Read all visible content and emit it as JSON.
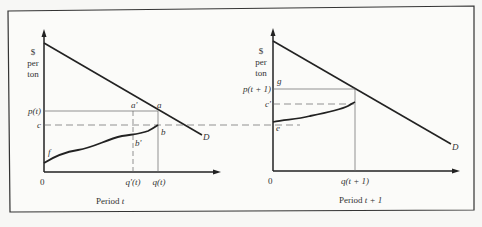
{
  "colors": {
    "ink": "#222222",
    "thin": "#666666",
    "background": "#f7f7f5"
  },
  "left_panel": {
    "y_axis_label": [
      "$",
      "per",
      "ton"
    ],
    "origin": "0",
    "caption_prefix": "Period ",
    "caption_var": "t",
    "demand_label": "D",
    "y_ticks": {
      "price": "p(t)",
      "cost": "c"
    },
    "x_ticks": {
      "q_prime": "q'(t)",
      "q": "q(t)"
    },
    "points": {
      "a": "a",
      "a_prime": "a'",
      "b": "b",
      "b_prime": "b'",
      "f": "f"
    }
  },
  "right_panel": {
    "y_axis_label": [
      "$",
      "per",
      "ton"
    ],
    "origin": "0",
    "caption_prefix": "Period ",
    "caption_var": "t + 1",
    "demand_label": "D",
    "y_ticks": {
      "price": "p(t + 1)",
      "cost": "c'"
    },
    "x_ticks": {
      "q": "q(t + 1)"
    },
    "points": {
      "g": "g",
      "e": "e"
    }
  }
}
